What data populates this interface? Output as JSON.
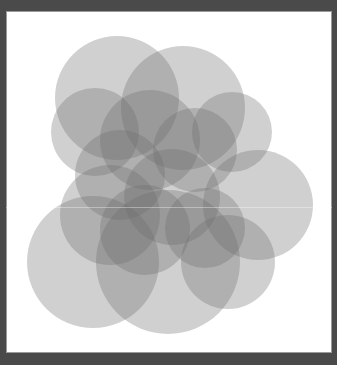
{
  "artwork": {
    "frame_color": "#4a4a4a",
    "canvas_color": "#ffffff",
    "circle_fill": "#6e6e6e",
    "circle_opacity": 0.32,
    "circles": [
      {
        "cx": 117,
        "cy": 98,
        "r": 62
      },
      {
        "cx": 183,
        "cy": 108,
        "r": 62
      },
      {
        "cx": 95,
        "cy": 132,
        "r": 44
      },
      {
        "cx": 150,
        "cy": 140,
        "r": 50
      },
      {
        "cx": 232,
        "cy": 132,
        "r": 40
      },
      {
        "cx": 195,
        "cy": 150,
        "r": 42
      },
      {
        "cx": 120,
        "cy": 175,
        "r": 45
      },
      {
        "cx": 258,
        "cy": 205,
        "r": 55
      },
      {
        "cx": 110,
        "cy": 215,
        "r": 50
      },
      {
        "cx": 172,
        "cy": 197,
        "r": 48
      },
      {
        "cx": 145,
        "cy": 230,
        "r": 45
      },
      {
        "cx": 93,
        "cy": 262,
        "r": 66
      },
      {
        "cx": 168,
        "cy": 262,
        "r": 72
      },
      {
        "cx": 228,
        "cy": 262,
        "r": 47
      },
      {
        "cx": 205,
        "cy": 228,
        "r": 40
      }
    ]
  }
}
